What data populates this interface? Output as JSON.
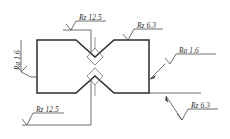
{
  "drawing": {
    "type": "surface-roughness-specification",
    "background_color": "#ffffff",
    "outline_color": "#2b2b2b",
    "annotation_color": "#4a4a4a",
    "part": {
      "name": "notched-specimen",
      "description": "Rectangular bar with opposing V-notches on the top and bottom edges"
    },
    "symbols": [
      {
        "id": "top-left",
        "parameter": "Rz",
        "value": "12.5",
        "label": "Rz 12.5",
        "symbol_type": "surface-finish-check-mark",
        "attachment": "extension-line",
        "target": "top-notch-left-flank"
      },
      {
        "id": "top-right",
        "parameter": "Rz",
        "value": "6.3",
        "label": "Rz 6.3",
        "symbol_type": "surface-finish-check-mark",
        "attachment": "on-surface",
        "target": "top-edge-right"
      },
      {
        "id": "left-side",
        "parameter": "Ra",
        "value": "1.6",
        "label": "Ra 1.6",
        "symbol_type": "surface-finish-check-mark",
        "attachment": "extension-line-rotated",
        "target": "left-edge",
        "rotated": true
      },
      {
        "id": "right-side",
        "parameter": "Ra",
        "value": "1.6",
        "label": "Ra 1.6",
        "symbol_type": "surface-finish-check-mark",
        "attachment": "leader-line-with-arrow",
        "target": "right-edge"
      },
      {
        "id": "bottom-left",
        "parameter": "Rz",
        "value": "12.5",
        "label": "Rz 12.5",
        "symbol_type": "surface-finish-check-mark",
        "attachment": "extension-line",
        "target": "bottom-notch-left-flank"
      },
      {
        "id": "bottom-right",
        "parameter": "Rz",
        "value": "6.3",
        "label": "Rz 6.3",
        "symbol_type": "surface-finish-check-mark",
        "attachment": "leader-line-with-arrow",
        "target": "bottom-edge-right"
      }
    ]
  }
}
